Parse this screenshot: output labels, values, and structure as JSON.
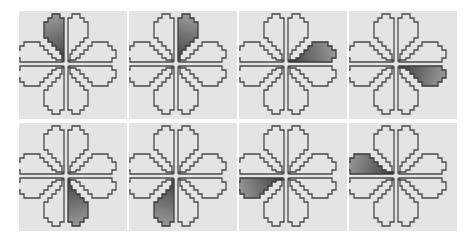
{
  "figure": {
    "layout": {
      "rows": 2,
      "columns": 4
    },
    "colors": {
      "panel_background": "#e4e4e4",
      "outline": "#4a4a4a",
      "highlight_dark": "#3c3c3c",
      "highlight_light": "#9a9a9a"
    },
    "petal_positions": [
      "upper-left-vertical",
      "upper-right-vertical",
      "right-upper-horizontal",
      "right-lower-horizontal",
      "lower-right-vertical",
      "lower-left-vertical",
      "left-lower-horizontal",
      "left-upper-horizontal"
    ],
    "panels": [
      {
        "index": 1,
        "row": 1,
        "col": 1,
        "highlighted_petal": "upper-left-vertical"
      },
      {
        "index": 2,
        "row": 1,
        "col": 2,
        "highlighted_petal": "upper-right-vertical"
      },
      {
        "index": 3,
        "row": 1,
        "col": 3,
        "highlighted_petal": "right-upper-horizontal"
      },
      {
        "index": 4,
        "row": 1,
        "col": 4,
        "highlighted_petal": "right-lower-horizontal"
      },
      {
        "index": 5,
        "row": 2,
        "col": 1,
        "highlighted_petal": "lower-right-vertical"
      },
      {
        "index": 6,
        "row": 2,
        "col": 2,
        "highlighted_petal": "lower-left-vertical"
      },
      {
        "index": 7,
        "row": 2,
        "col": 3,
        "highlighted_petal": "left-lower-horizontal"
      },
      {
        "index": 8,
        "row": 2,
        "col": 4,
        "highlighted_petal": "left-upper-horizontal"
      }
    ]
  }
}
